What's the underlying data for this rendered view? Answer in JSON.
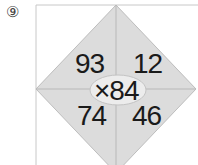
{
  "problem": {
    "label": "⑨",
    "operator": "×",
    "center_value": "84",
    "center_text": "×84",
    "cells": {
      "top_left": "93",
      "top_right": "12",
      "bottom_left": "74",
      "bottom_right": "46"
    }
  },
  "colors": {
    "diamond_fill": "#dcdcdc",
    "lines": "#b8b8b8",
    "oval_fill": "#ececec",
    "text": "#1a1a1a"
  }
}
